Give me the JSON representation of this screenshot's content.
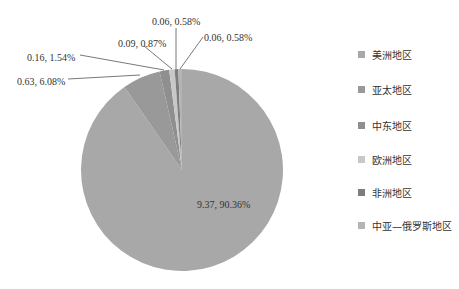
{
  "chart_data": {
    "type": "pie",
    "title": "",
    "categories": [
      "美洲地区",
      "亚太地区",
      "中东地区",
      "欧洲地区",
      "非洲地区",
      "中亚—俄罗斯地区"
    ],
    "values": [
      9.37,
      0.63,
      0.16,
      0.09,
      0.06,
      0.06
    ],
    "percentages": [
      90.36,
      6.08,
      1.54,
      0.87,
      0.58,
      0.58
    ],
    "data_labels": [
      "9.37, 90.36%",
      "0.63, 6.08%",
      "0.16, 1.54%",
      "0.09, 0.87%",
      "0.06, 0.58%",
      "0.06, 0.58%"
    ],
    "colors": [
      "#a8a8a8",
      "#999999",
      "#8f8f8f",
      "#c8c8c8",
      "#7d7d7d",
      "#b4b4b4"
    ],
    "legend_position": "right",
    "start_angle": "12 o'clock",
    "direction": "clockwise"
  },
  "legend": {
    "items": [
      {
        "label": "美洲地区",
        "color": "#a8a8a8"
      },
      {
        "label": "亚太地区",
        "color": "#999999"
      },
      {
        "label": "中东地区",
        "color": "#8f8f8f"
      },
      {
        "label": "欧洲地区",
        "color": "#c8c8c8"
      },
      {
        "label": "非洲地区",
        "color": "#7d7d7d"
      },
      {
        "label": "中亚—俄罗斯地区",
        "color": "#b4b4b4"
      }
    ]
  },
  "labels": {
    "l0": "9.37, 90.36%",
    "l1": "0.63, 6.08%",
    "l2": "0.16, 1.54%",
    "l3": "0.09, 0.87%",
    "l4": "0.06, 0.58%",
    "l5": "0.06, 0.58%"
  }
}
